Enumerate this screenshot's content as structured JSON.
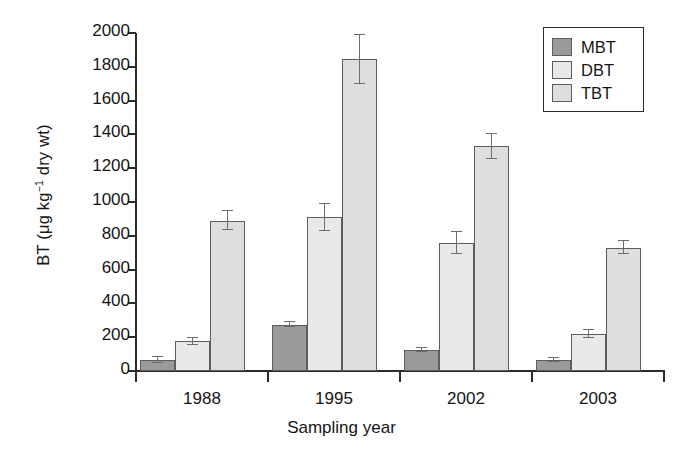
{
  "chart_data": {
    "type": "bar",
    "title": "",
    "subtitle": "",
    "xlabel": "Sampling year",
    "ylabel": "BT (μg kg⁻¹ dry wt)",
    "ylabel_parts": {
      "prefix": "BT (μg kg",
      "exponent": "−1",
      "suffix": " dry wt)"
    },
    "categories": [
      "1988",
      "1995",
      "2002",
      "2003"
    ],
    "series": [
      {
        "name": "MBT",
        "color": "#9a9a9a",
        "values": [
          65,
          275,
          125,
          65
        ],
        "errors": [
          18,
          15,
          12,
          12
        ]
      },
      {
        "name": "DBT",
        "color": "#e9e9e9",
        "values": [
          175,
          910,
          755,
          220
        ],
        "errors": [
          20,
          80,
          65,
          25
        ]
      },
      {
        "name": "TBT",
        "color": "#dedede",
        "values": [
          890,
          1845,
          1330,
          730
        ],
        "errors": [
          55,
          145,
          75,
          40
        ]
      }
    ],
    "ylim": [
      0,
      2000
    ],
    "yticks": [
      0,
      200,
      400,
      600,
      800,
      1000,
      1200,
      1400,
      1600,
      1800,
      2000
    ],
    "ytick_labels": [
      "0",
      "200",
      "400",
      "600",
      "800",
      "1000",
      "1200",
      "1400",
      "1600",
      "1800",
      "2000"
    ],
    "grid": false,
    "legend_position": "top-right",
    "frame": "left-bottom"
  },
  "legend": {
    "entries": [
      {
        "label": "MBT",
        "color": "#9a9a9a"
      },
      {
        "label": "DBT",
        "color": "#e9e9e9"
      },
      {
        "label": "TBT",
        "color": "#dedede"
      }
    ]
  }
}
